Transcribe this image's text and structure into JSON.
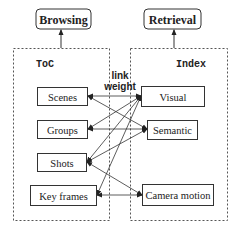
{
  "top": {
    "browsing": {
      "label": "Browsing"
    },
    "retrieval": {
      "label": "Retrieval"
    }
  },
  "toc": {
    "title": "ToC",
    "nodes": [
      {
        "id": "scenes",
        "label": "Scenes"
      },
      {
        "id": "groups",
        "label": "Groups"
      },
      {
        "id": "shots",
        "label": "Shots"
      },
      {
        "id": "keyframes",
        "label": "Key frames"
      }
    ]
  },
  "index": {
    "title": "Index",
    "nodes": [
      {
        "id": "visual",
        "label": "Visual"
      },
      {
        "id": "semantic",
        "label": "Semantic"
      },
      {
        "id": "camera",
        "label": "Camera motion"
      }
    ]
  },
  "link_label": {
    "line1": "link",
    "line2": "weight"
  },
  "edges": [
    {
      "from": "visual",
      "to": "scenes"
    },
    {
      "from": "visual",
      "to": "groups"
    },
    {
      "from": "visual",
      "to": "shots"
    },
    {
      "from": "visual",
      "to": "keyframes"
    },
    {
      "from": "semantic",
      "to": "scenes"
    },
    {
      "from": "semantic",
      "to": "groups"
    },
    {
      "from": "semantic",
      "to": "shots"
    },
    {
      "from": "camera",
      "to": "shots"
    },
    {
      "from": "camera",
      "to": "keyframes"
    }
  ],
  "colors": {
    "stroke": "#333333",
    "text": "#222222",
    "dotted": "#555555"
  }
}
